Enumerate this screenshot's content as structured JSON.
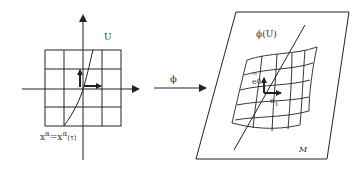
{
  "diagram": {
    "left_panel": {
      "region_label": "U",
      "curve_label_lhs": "x",
      "curve_label_sup1": "α",
      "curve_label_eq": "=x",
      "curve_label_sup2": "α",
      "curve_label_rhs": "(τ)",
      "grid": {
        "rows": 4,
        "cols": 4
      }
    },
    "map": {
      "label": "ϕ"
    },
    "right_panel": {
      "patch_label": "ϕ(U)",
      "manifold_label": "M",
      "vector_e0_label": "e",
      "vector_e0_sub": "0",
      "vector_e0_arrow": "→",
      "vector_e1_label": "e",
      "vector_e1_sub": "1"
    },
    "colors": {
      "ink": "#222222",
      "background": "#ffffff"
    }
  }
}
